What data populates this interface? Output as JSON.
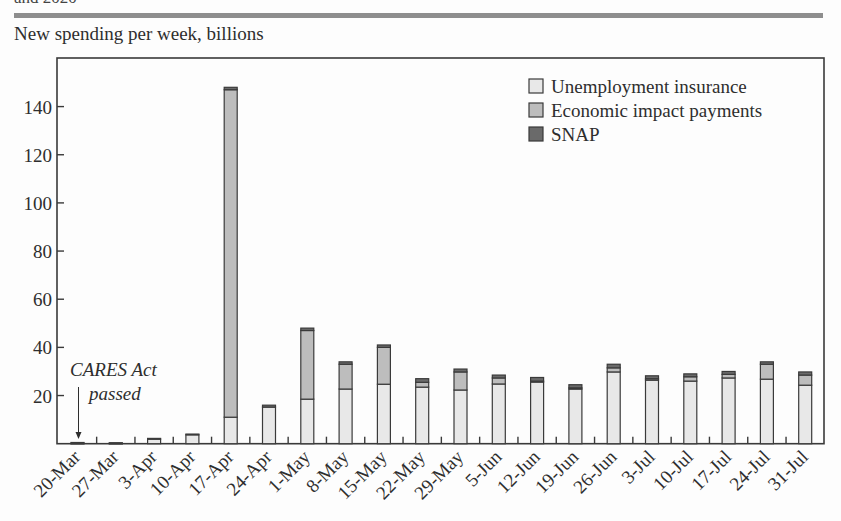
{
  "header": {
    "cut_text": "and 2020",
    "subtitle": "New spending per week, billions"
  },
  "colors": {
    "unemployment_insurance": "#e8e8e8",
    "economic_impact_payments": "#bdbdbd",
    "snap": "#6a6a6a",
    "outline": "#3a3a3a",
    "rule": "#8e8e8e"
  },
  "annotation": {
    "line1": "CARES Act",
    "line2": "passed",
    "target": "20-Mar"
  },
  "chart_data": {
    "type": "bar",
    "stacked": true,
    "title": "New spending per week, billions",
    "xlabel": "",
    "ylabel": "New spending per week, billions",
    "ylim": [
      0,
      158
    ],
    "yticks": [
      20,
      40,
      60,
      80,
      100,
      120,
      140
    ],
    "grid": false,
    "legend_position": "upper right",
    "categories": [
      "20-Mar",
      "27-Mar",
      "3-Apr",
      "10-Apr",
      "17-Apr",
      "24-Apr",
      "1-May",
      "8-May",
      "15-May",
      "22-May",
      "29-May",
      "5-Jun",
      "12-Jun",
      "19-Jun",
      "26-Jun",
      "3-Jul",
      "10-Jul",
      "17-Jul",
      "24-Jul",
      "31-Jul"
    ],
    "series": [
      {
        "name": "Unemployment insurance",
        "values": [
          0.2,
          0.2,
          1.9,
          3.7,
          11,
          15.2,
          18.5,
          22.7,
          24.7,
          23.5,
          22.3,
          24.8,
          25.6,
          22.7,
          29.8,
          26.4,
          26,
          27.3,
          26.8,
          24.3
        ]
      },
      {
        "name": "Economic impact payments",
        "values": [
          0,
          0,
          0,
          0,
          136,
          0,
          28.5,
          10.3,
          15.3,
          2,
          7.5,
          2.5,
          0.4,
          0.5,
          1.7,
          0.6,
          1.8,
          1.5,
          6.2,
          4.2
        ]
      },
      {
        "name": "SNAP",
        "values": [
          0.3,
          0.2,
          0.3,
          0.3,
          1,
          0.8,
          1,
          1,
          1,
          1.5,
          1.2,
          1.2,
          1.5,
          1.3,
          1.5,
          1.2,
          1.2,
          1.2,
          1,
          1.3
        ]
      }
    ],
    "annotations": [
      {
        "text": "CARES Act passed",
        "x": "20-Mar",
        "style": "italic",
        "arrow": true
      }
    ]
  },
  "legend": [
    {
      "label": "Unemployment insurance",
      "key": "unemployment_insurance"
    },
    {
      "label": "Economic impact payments",
      "key": "economic_impact_payments"
    },
    {
      "label": "SNAP",
      "key": "snap"
    }
  ]
}
